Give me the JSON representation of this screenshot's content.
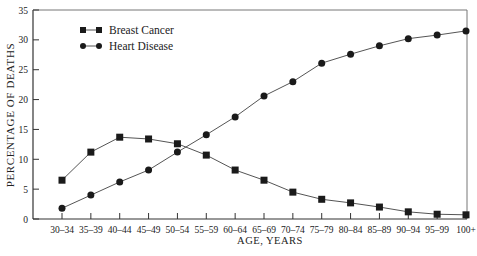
{
  "chart_data": {
    "type": "line",
    "title": "",
    "xlabel": "AGE, YEARS",
    "ylabel": "PERCENTAGE OF DEATHS",
    "ylim": [
      0,
      35
    ],
    "yticks": [
      0,
      5,
      10,
      15,
      20,
      25,
      30,
      35
    ],
    "grid": false,
    "legend_position": "upper-left",
    "categories": [
      "30–34",
      "35–39",
      "40–44",
      "45–49",
      "50–54",
      "55–59",
      "60–64",
      "65–69",
      "70–74",
      "75–79",
      "80–84",
      "85–89",
      "90–94",
      "95–99",
      "100+"
    ],
    "series": [
      {
        "name": "Breast Cancer",
        "marker": "square",
        "values": [
          6.5,
          11.2,
          13.7,
          13.4,
          12.6,
          10.7,
          8.2,
          6.5,
          4.5,
          3.3,
          2.7,
          2.0,
          1.2,
          0.8,
          0.7
        ]
      },
      {
        "name": "Heart Disease",
        "marker": "circle",
        "values": [
          1.8,
          4.0,
          6.2,
          8.2,
          11.2,
          14.1,
          17.1,
          20.6,
          23.0,
          26.1,
          27.6,
          29.0,
          30.2,
          30.8,
          31.5
        ]
      }
    ]
  },
  "colors": {
    "line": "#555555",
    "marker": "#1a1a1a",
    "axis": "#333333"
  }
}
